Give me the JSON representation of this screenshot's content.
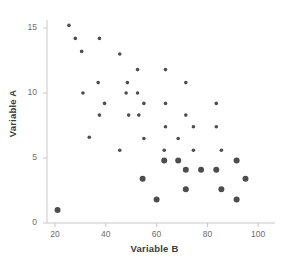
{
  "chart_data": {
    "type": "scatter",
    "title": "",
    "xlabel": "Variable B",
    "ylabel": "Variable A",
    "xlim": [
      16,
      106
    ],
    "ylim": [
      0,
      16.2
    ],
    "xticks": [
      20,
      40,
      60,
      80,
      100
    ],
    "yticks": [
      0,
      5,
      10,
      15
    ],
    "grid": false,
    "legend": null,
    "marker_color": "#4d4d4d",
    "axis_color": "#c8c8c8",
    "series": [
      {
        "name": "observations",
        "marker": "circle",
        "points": [
          {
            "x": 21,
            "y": 1.0,
            "size": "large"
          },
          {
            "x": 25.5,
            "y": 15.2,
            "size": "small"
          },
          {
            "x": 28,
            "y": 14.2,
            "size": "small"
          },
          {
            "x": 30.5,
            "y": 13.2,
            "size": "small"
          },
          {
            "x": 37.5,
            "y": 14.2,
            "size": "small"
          },
          {
            "x": 31,
            "y": 10.0,
            "size": "small"
          },
          {
            "x": 37,
            "y": 10.8,
            "size": "small"
          },
          {
            "x": 39.5,
            "y": 9.2,
            "size": "small"
          },
          {
            "x": 45.5,
            "y": 13.0,
            "size": "small"
          },
          {
            "x": 37.5,
            "y": 8.3,
            "size": "small"
          },
          {
            "x": 33.5,
            "y": 6.6,
            "size": "small"
          },
          {
            "x": 45.5,
            "y": 5.6,
            "size": "small"
          },
          {
            "x": 48.5,
            "y": 10.8,
            "size": "small"
          },
          {
            "x": 48,
            "y": 10.0,
            "size": "small"
          },
          {
            "x": 52.5,
            "y": 11.8,
            "size": "small"
          },
          {
            "x": 52.5,
            "y": 10.0,
            "size": "small"
          },
          {
            "x": 49,
            "y": 8.3,
            "size": "small"
          },
          {
            "x": 53,
            "y": 8.3,
            "size": "small"
          },
          {
            "x": 55,
            "y": 6.5,
            "size": "small"
          },
          {
            "x": 55,
            "y": 9.2,
            "size": "small"
          },
          {
            "x": 54.5,
            "y": 3.4,
            "size": "large"
          },
          {
            "x": 60,
            "y": 1.8,
            "size": "large"
          },
          {
            "x": 63.5,
            "y": 11.8,
            "size": "small"
          },
          {
            "x": 63.5,
            "y": 9.2,
            "size": "small"
          },
          {
            "x": 63.5,
            "y": 7.4,
            "size": "small"
          },
          {
            "x": 63,
            "y": 5.6,
            "size": "small"
          },
          {
            "x": 63,
            "y": 4.8,
            "size": "large"
          },
          {
            "x": 68.5,
            "y": 6.5,
            "size": "small"
          },
          {
            "x": 68.5,
            "y": 4.8,
            "size": "large"
          },
          {
            "x": 71.5,
            "y": 10.8,
            "size": "small"
          },
          {
            "x": 71.5,
            "y": 8.3,
            "size": "small"
          },
          {
            "x": 74.5,
            "y": 7.4,
            "size": "small"
          },
          {
            "x": 74.5,
            "y": 5.6,
            "size": "small"
          },
          {
            "x": 71.5,
            "y": 4.1,
            "size": "large"
          },
          {
            "x": 71.5,
            "y": 2.6,
            "size": "large"
          },
          {
            "x": 77.5,
            "y": 4.1,
            "size": "large"
          },
          {
            "x": 83.5,
            "y": 9.2,
            "size": "small"
          },
          {
            "x": 83.5,
            "y": 7.4,
            "size": "small"
          },
          {
            "x": 85.5,
            "y": 5.6,
            "size": "small"
          },
          {
            "x": 83.5,
            "y": 4.1,
            "size": "large"
          },
          {
            "x": 85.5,
            "y": 2.6,
            "size": "large"
          },
          {
            "x": 91.5,
            "y": 4.8,
            "size": "large"
          },
          {
            "x": 91.5,
            "y": 1.8,
            "size": "large"
          },
          {
            "x": 95,
            "y": 3.4,
            "size": "large"
          }
        ]
      }
    ]
  }
}
